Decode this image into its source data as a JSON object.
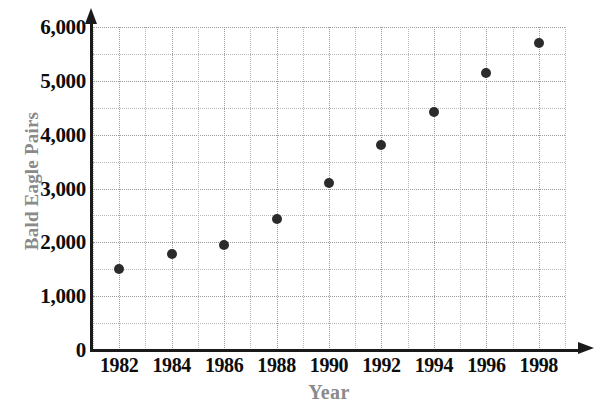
{
  "chart_data": {
    "type": "scatter",
    "title": "",
    "xlabel": "Year",
    "ylabel": "Bald Eagle Pairs",
    "x": [
      1982,
      1984,
      1986,
      1988,
      1990,
      1992,
      1994,
      1996,
      1998
    ],
    "values": [
      1500,
      1780,
      1950,
      2440,
      3110,
      3810,
      4430,
      5150,
      5700
    ],
    "series": [
      {
        "name": "Bald Eagle Pairs",
        "values": [
          1500,
          1780,
          1950,
          2440,
          3110,
          3810,
          4430,
          5150,
          5700
        ]
      }
    ],
    "xlim": [
      1981,
      1999
    ],
    "ylim": [
      0,
      6000
    ],
    "x_tick_labels": [
      "1982",
      "1984",
      "1986",
      "1988",
      "1990",
      "1992",
      "1994",
      "1996",
      "1998"
    ],
    "x_tick_values": [
      1982,
      1984,
      1986,
      1988,
      1990,
      1992,
      1994,
      1996,
      1998
    ],
    "x_minor_step": 1,
    "y_tick_labels": [
      "0",
      "1,000",
      "2,000",
      "3,000",
      "4,000",
      "5,000",
      "6,000"
    ],
    "y_tick_values": [
      0,
      1000,
      2000,
      3000,
      4000,
      5000,
      6000
    ],
    "y_minor_step": 500,
    "grid": true,
    "grid_style": "dotted",
    "legend": false,
    "legend_position": "none",
    "marker": "filled-circle",
    "marker_color": "#2b2b2b",
    "axis_color": "#1a1a1a",
    "grid_color": "#b8b8b8",
    "axis_title_color": "#8a8a8a",
    "tick_label_color": "#0d0d0d",
    "background_color": "#ffffff"
  }
}
